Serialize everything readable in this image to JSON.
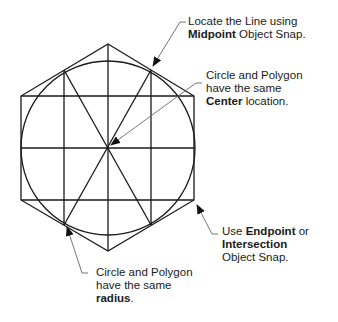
{
  "annotations": {
    "midpoint": {
      "line1": "Locate the Line using",
      "bold": "Midpoint",
      "rest": " Object Snap."
    },
    "center": {
      "line1": "Circle and Polygon",
      "line2": "have the same",
      "bold": "Center",
      "rest": " location."
    },
    "endpoint": {
      "pre": "Use ",
      "bold1": "Endpoint",
      "post": " or",
      "bold2": "Intersection",
      "line3": "Object Snap."
    },
    "radius": {
      "line1": "Circle and Polygon",
      "line2": "have the same",
      "bold": "radius",
      "rest": "."
    }
  },
  "geometry": {
    "center": [
      108,
      148
    ],
    "circle_radius": 87,
    "hexagon_vertices": [
      [
        108,
        44
      ],
      [
        194,
        96
      ],
      [
        194,
        200
      ],
      [
        108,
        251
      ],
      [
        21,
        200
      ],
      [
        21,
        96
      ]
    ],
    "stroke_color": "#1a1a1a",
    "leader_color": "#666666"
  }
}
